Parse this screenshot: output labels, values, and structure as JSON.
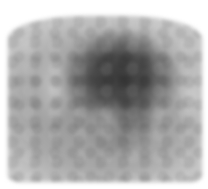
{
  "image": {
    "description": "Grayscale tomographic scan slice with a dark central high-uptake region on a lighter gray background",
    "colors": {
      "dark_region": "#3a3a3a",
      "mid_gray": "#9a9a9a",
      "light_gray": "#c4c4c4",
      "background": "#ffffff"
    }
  }
}
